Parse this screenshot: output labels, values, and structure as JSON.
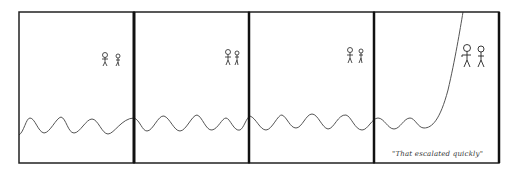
{
  "comic": {
    "panels": 4,
    "caption": "\"That escalated quickly\"",
    "colors": {
      "ink": "#222222",
      "background": "#ffffff",
      "line": "#555555"
    }
  }
}
